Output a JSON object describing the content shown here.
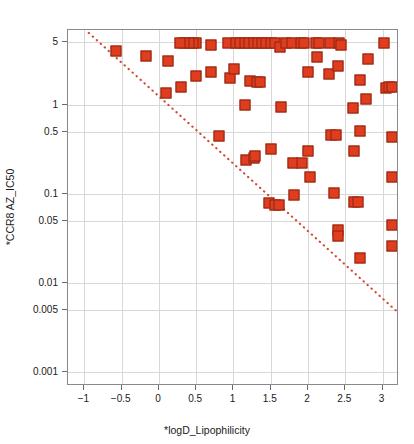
{
  "chart_data": {
    "type": "scatter",
    "title": "",
    "xlabel": "*logD_Lipophilicity",
    "ylabel": "*CCR8 AZ_IC50",
    "yscale": "log",
    "xscale": "linear",
    "xlim": [
      -1.22,
      3.22
    ],
    "ylim": [
      0.0007,
      6.9
    ],
    "grid": true,
    "legend": null,
    "xticks": [
      -1,
      -0.5,
      0,
      0.5,
      1,
      1.5,
      2,
      2.5,
      3
    ],
    "xtick_labels": [
      "−1",
      "−0.5",
      "0",
      "0.5",
      "1",
      "1.5",
      "2",
      "2.5",
      "3"
    ],
    "yticks": [
      5,
      1,
      0.5,
      0.1,
      0.05,
      0.01,
      0.005,
      0.001
    ],
    "ytick_labels": [
      "5",
      "1",
      "0.5",
      "0.1",
      "0.05",
      "0.01",
      "0.005",
      "0.001"
    ],
    "marker": {
      "shape": "square",
      "fill_color": "#e03c1e",
      "edge_color": "#8a2411",
      "size_px": 11
    },
    "reference_line": {
      "style": "dotted",
      "color": "#cf4a33",
      "x_start": -0.94,
      "y_start": 6.4,
      "x_end": 3.22,
      "y_end": 0.0046,
      "note": "diagonal lipophilic-efficiency boundary"
    },
    "points": [
      [
        -0.58,
        4.0
      ],
      [
        -0.17,
        3.5
      ],
      [
        0.1,
        1.35
      ],
      [
        0.12,
        3.1
      ],
      [
        0.3,
        1.6
      ],
      [
        0.5,
        5.0
      ],
      [
        0.46,
        5.0
      ],
      [
        0.4,
        5.0
      ],
      [
        0.33,
        5.0
      ],
      [
        0.28,
        5.0
      ],
      [
        0.5,
        2.1
      ],
      [
        0.7,
        4.7
      ],
      [
        0.7,
        2.35
      ],
      [
        0.8,
        0.45
      ],
      [
        0.92,
        5.0
      ],
      [
        0.95,
        2.0
      ],
      [
        1.0,
        2.55
      ],
      [
        1.03,
        5.0
      ],
      [
        1.09,
        5.0
      ],
      [
        1.15,
        1.0
      ],
      [
        1.15,
        5.0
      ],
      [
        1.21,
        5.0
      ],
      [
        1.27,
        5.0
      ],
      [
        1.33,
        5.0
      ],
      [
        1.38,
        5.0
      ],
      [
        1.44,
        5.0
      ],
      [
        1.22,
        1.85
      ],
      [
        1.31,
        1.8
      ],
      [
        1.35,
        1.8
      ],
      [
        1.17,
        0.24
      ],
      [
        1.27,
        0.25
      ],
      [
        1.29,
        0.27
      ],
      [
        1.5,
        0.32
      ],
      [
        1.48,
        0.079
      ],
      [
        1.56,
        0.076
      ],
      [
        1.61,
        0.075
      ],
      [
        1.5,
        5.0
      ],
      [
        1.56,
        5.0
      ],
      [
        1.62,
        4.45
      ],
      [
        1.64,
        0.95
      ],
      [
        1.7,
        5.0
      ],
      [
        1.78,
        5.0
      ],
      [
        1.8,
        0.22
      ],
      [
        1.81,
        0.097
      ],
      [
        1.9,
        5.0
      ],
      [
        1.95,
        5.0
      ],
      [
        1.92,
        0.225
      ],
      [
        2.0,
        0.3
      ],
      [
        2.0,
        2.35
      ],
      [
        2.02,
        0.155
      ],
      [
        2.1,
        5.0
      ],
      [
        2.15,
        5.0
      ],
      [
        2.12,
        3.4
      ],
      [
        2.3,
        5.0
      ],
      [
        2.28,
        2.2
      ],
      [
        2.31,
        0.46
      ],
      [
        2.38,
        0.46
      ],
      [
        2.35,
        0.102
      ],
      [
        2.4,
        2.7
      ],
      [
        2.4,
        0.039
      ],
      [
        2.4,
        0.034
      ],
      [
        2.42,
        4.9
      ],
      [
        2.44,
        4.75
      ],
      [
        2.6,
        0.93
      ],
      [
        2.61,
        0.082
      ],
      [
        2.67,
        0.082
      ],
      [
        2.62,
        0.3
      ],
      [
        2.7,
        1.9
      ],
      [
        2.7,
        0.51
      ],
      [
        2.7,
        0.019
      ],
      [
        2.78,
        1.15
      ],
      [
        2.8,
        3.3
      ],
      [
        3.02,
        4.9
      ],
      [
        3.05,
        1.55
      ],
      [
        3.08,
        1.6
      ],
      [
        3.12,
        1.6
      ],
      [
        3.12,
        0.43
      ],
      [
        3.12,
        0.155
      ],
      [
        3.12,
        0.045
      ],
      [
        3.12,
        0.026
      ]
    ]
  },
  "axes": {
    "x_title": "*logD_Lipophilicity",
    "y_title": "*CCR8 AZ_IC50"
  }
}
